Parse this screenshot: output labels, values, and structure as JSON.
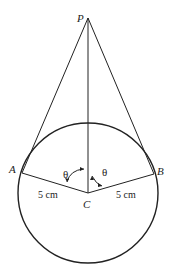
{
  "diagram": {
    "type": "geometry",
    "points": {
      "P": {
        "label": "P"
      },
      "A": {
        "label": "A"
      },
      "B": {
        "label": "B"
      },
      "C": {
        "label": "C"
      }
    },
    "labels": {
      "radius_left": "5 cm",
      "radius_right": "5 cm",
      "angle_left": "θ",
      "angle_right": "θ"
    },
    "colors": {
      "stroke": "#222222",
      "background": "#ffffff"
    }
  }
}
